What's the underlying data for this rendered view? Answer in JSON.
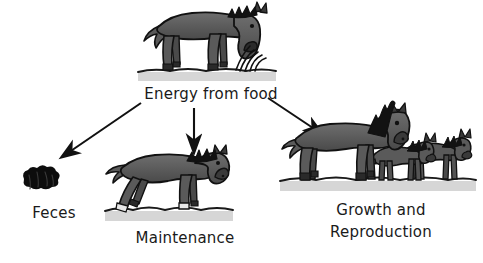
{
  "diagram": {
    "title_text_present": false,
    "background_color": "#ffffff",
    "body_color": "#555555",
    "body_shade_color": "#6b6b6b",
    "outline_color": "#111111",
    "mane_color": "#141414",
    "ground_shadow_color": "#d4d4d4",
    "ground_line_color": "#1a1a1a",
    "arrow_color": "#111111"
  },
  "nodes": {
    "source": {
      "label": "Energy from food",
      "icon": "grazing-horse-icon",
      "label_x": 136,
      "label_y": 84
    },
    "feces": {
      "label": "Feces",
      "icon": "feces-blob-icon",
      "label_x": 14,
      "label_y": 203
    },
    "maintenance": {
      "label": "Maintenance",
      "icon": "walking-horse-icon",
      "label_x": 130,
      "label_y": 228
    },
    "growth": {
      "label_line1": "Growth and",
      "label_line2": "Reproduction",
      "icon": "mare-and-foals-icon",
      "label_x": 314,
      "label_y": 200
    }
  },
  "arrows": [
    {
      "name": "arrow-to-feces",
      "from": "source",
      "to": "feces",
      "direction": "down-left"
    },
    {
      "name": "arrow-to-maintenance",
      "from": "source",
      "to": "maintenance",
      "direction": "down"
    },
    {
      "name": "arrow-to-growth",
      "from": "source",
      "to": "growth",
      "direction": "down-right"
    }
  ]
}
